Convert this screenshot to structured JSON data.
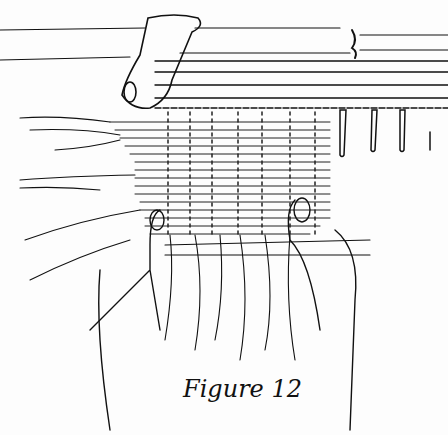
{
  "figure": {
    "caption": "Figure 12",
    "colors": {
      "ink": "#111111",
      "paper": "#fdfdfd"
    }
  }
}
